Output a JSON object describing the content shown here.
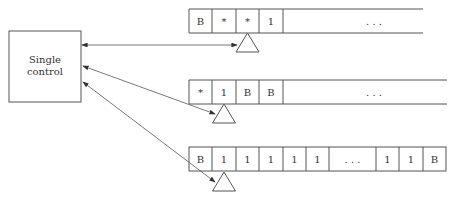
{
  "control": {
    "line1": "Single",
    "line2": "control"
  },
  "tapes": [
    {
      "cells": [
        "B",
        "*",
        "*",
        "1"
      ],
      "ellipsis": ". . .",
      "head_index": 2
    },
    {
      "cells": [
        "*",
        "1",
        "B",
        "B"
      ],
      "ellipsis": ". . .",
      "head_index": 1
    },
    {
      "cells": [
        "B",
        "1",
        "1",
        "1",
        "1",
        "1",
        ". . .",
        "1",
        "1",
        "B"
      ],
      "head_index": 1
    }
  ],
  "colors": {
    "stroke": "#555555",
    "text": "#333333",
    "background": "#ffffff"
  }
}
